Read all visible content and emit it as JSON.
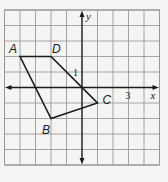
{
  "diagram": {
    "type": "coordinate-plane-polygon",
    "grid": {
      "x_min": -5,
      "x_max": 5,
      "y_min": -5,
      "y_max": 5,
      "origin_px": [
        82,
        87.5
      ],
      "unit_px": 15.5,
      "line_color": "#9a9a9a",
      "border_color": "#8a8a8a",
      "background": "#f4f4f2"
    },
    "axes": {
      "x_label": "x",
      "y_label": "y",
      "color": "#1a1a1a",
      "tick_labels": [
        {
          "axis": "y",
          "value": 1,
          "text": "1"
        },
        {
          "axis": "x",
          "value": 3,
          "text": "3"
        }
      ]
    },
    "polygon": {
      "name": "ABCD",
      "stroke": "#1a1a1a",
      "vertices": [
        {
          "label": "A",
          "x": -4,
          "y": 2
        },
        {
          "label": "B",
          "x": -2,
          "y": -2
        },
        {
          "label": "C",
          "x": 1,
          "y": -1
        },
        {
          "label": "D",
          "x": -2,
          "y": 2
        }
      ]
    }
  }
}
